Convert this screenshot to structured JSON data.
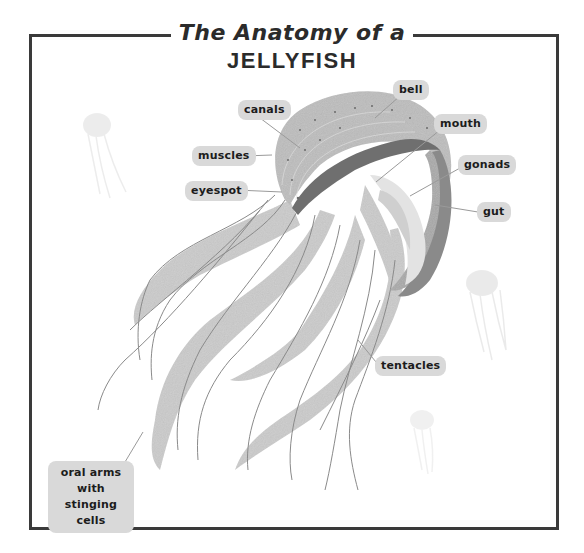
{
  "title": {
    "line1": "The Anatomy of a",
    "line2": "JELLYFISH"
  },
  "labels": {
    "canals": "canals",
    "bell": "bell",
    "mouth": "mouth",
    "muscles": "muscles",
    "gonads": "gonads",
    "eyespot": "eyespot",
    "gut": "gut",
    "tentacles": "tentacles",
    "oral_arms": "oral arms with stinging cells"
  },
  "colors": {
    "frame": "#3a3a3a",
    "label_bg": "#d9d9d9",
    "label_text": "#1c1c1c",
    "bell": "#bdbdbd",
    "bell_rim": "#6f6f6f",
    "arms": "#c8c8c8",
    "tentacle_line": "#8a8a8a"
  }
}
